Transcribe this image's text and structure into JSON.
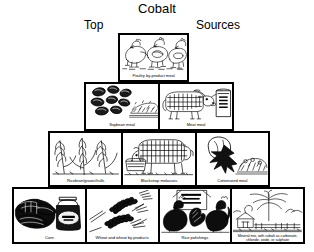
{
  "header": {
    "title": "Cobalt",
    "left_word": "Top",
    "right_word": "Sources"
  },
  "colors": {
    "border": "#000000",
    "background": "#ffffff",
    "ink": "#000000"
  },
  "pyramid": {
    "tiers": [
      {
        "rank": 1,
        "cells": [
          {
            "caption": "Poultry by-product meal",
            "art": "poultry-illustration"
          }
        ]
      },
      {
        "rank": 2,
        "cells": [
          {
            "caption": "Soybean meal",
            "art": "soybeans-illustration"
          },
          {
            "caption": "Meat meal",
            "art": "cow-and-feed-bag-illustration"
          }
        ]
      },
      {
        "rank": 3,
        "cells": [
          {
            "caption": "Ricebran/groats/hulls",
            "art": "grain-stalks-illustration"
          },
          {
            "caption": "Blackstrap molasses",
            "art": "cow-at-trough-illustration"
          },
          {
            "caption": "Cottonseed meal",
            "art": "cotton-boll-illustration"
          }
        ]
      },
      {
        "rank": 4,
        "cells": [
          {
            "caption": "Corn",
            "art": "corn-and-jar-illustration"
          },
          {
            "caption": "Wheat and wheat by-products",
            "art": "wheat-ears-illustration"
          },
          {
            "caption": "Rice polishings",
            "art": "chickens-illustration"
          },
          {
            "caption": "Mineral mix, with cobalt as carbonate, chloride, oxide, or sulphate",
            "art": "mineral-mix-illustration"
          }
        ]
      }
    ]
  }
}
